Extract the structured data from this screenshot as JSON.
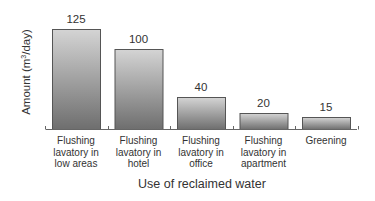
{
  "chart_data": {
    "type": "bar",
    "title": "",
    "xlabel": "Use of reclaimed water",
    "ylabel": "Amount (m³/day)",
    "ylabel_parts": {
      "prefix": "Amount (m",
      "sup": "3",
      "suffix": "/day)"
    },
    "categories": [
      "Flushing lavatory in low areas",
      "Flushing lavatory in hotel",
      "Flushing lavatory in office",
      "Flushing lavatory in apartment",
      "Greening"
    ],
    "category_lines": [
      [
        "Flushing",
        "lavatory in",
        "low areas"
      ],
      [
        "Flushing",
        "lavatory in",
        "hotel"
      ],
      [
        "Flushing",
        "lavatory in",
        "office"
      ],
      [
        "Flushing",
        "lavatory in",
        "apartment"
      ],
      [
        "Greening"
      ]
    ],
    "values": [
      125,
      100,
      40,
      20,
      15
    ],
    "value_labels": [
      "125",
      "100",
      "40",
      "20",
      "15"
    ],
    "ylim": [
      0,
      125
    ],
    "grid": false,
    "legend": null,
    "bar_color_top": "#d4d4d4",
    "bar_color_bottom": "#6e6e6e"
  }
}
